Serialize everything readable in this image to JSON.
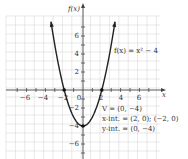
{
  "chart_data": {
    "type": "line",
    "title": "",
    "function_label": "f(x) = x² − 4",
    "xlabel": "x",
    "ylabel": "f(x)",
    "xlim": [
      -7.5,
      7.5
    ],
    "ylim": [
      -7.5,
      8
    ],
    "grid": true,
    "x_ticks": [
      -6,
      -4,
      -2,
      2,
      4,
      6
    ],
    "y_ticks": [
      -6,
      -4,
      -2,
      2,
      4,
      6
    ],
    "origin_label": "0",
    "series": [
      {
        "name": "f(x) = x² − 4",
        "x": [
          -3.4,
          -3,
          -2.5,
          -2,
          -1.5,
          -1,
          -0.5,
          0,
          0.5,
          1,
          1.5,
          2,
          2.5,
          3,
          3.4
        ],
        "y": [
          7.56,
          5,
          2.25,
          0,
          -1.75,
          -3,
          -3.75,
          -4,
          -3.75,
          -3,
          -1.75,
          0,
          2.25,
          5,
          7.56
        ]
      }
    ],
    "points": [
      {
        "label": "vertex",
        "x": 0,
        "y": -4
      },
      {
        "label": "x-intercept",
        "x": -2,
        "y": 0
      },
      {
        "label": "x-intercept",
        "x": 2,
        "y": 0
      }
    ],
    "annotations": {
      "vertex": "V = (0, −4)",
      "x_intercepts": "x-int. = (2, 0); (−2, 0)",
      "y_intercept": "y-int. = (0, −4)"
    }
  },
  "labels": {
    "y_axis": "f(x)",
    "x_axis": "x",
    "origin": "0",
    "function": "f(x) = x² − 4",
    "vertex": "V = (0, −4)",
    "x_int": "x-int. = (2, 0); (−2, 0)",
    "y_int": "y-int. = (0, −4)",
    "x_tick_labels": [
      "−6",
      "−4",
      "−2",
      "2",
      "4",
      "6"
    ],
    "y_tick_labels": [
      "6",
      "4",
      "2",
      "−2",
      "−4",
      "−6"
    ]
  }
}
